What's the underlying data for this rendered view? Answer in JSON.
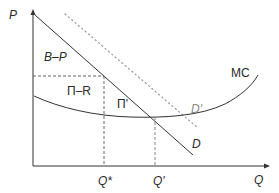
{
  "diagram": {
    "type": "economics-supply-demand",
    "axes": {
      "y_label": "P",
      "x_label": "Q"
    },
    "curves": {
      "demand": {
        "label": "D",
        "style": "solid"
      },
      "demand_shifted": {
        "label": "D'",
        "style": "dotted"
      },
      "marginal_cost": {
        "label": "MC",
        "style": "solid"
      }
    },
    "regions": {
      "upper": "B–P",
      "middle": "Π–R",
      "triangle": "Π'"
    },
    "quantities": {
      "q_star": "Q*",
      "q_prime": "Q'"
    },
    "colors": {
      "line": "#333333",
      "dotted": "#9a9a9a",
      "dashed": "#555555"
    }
  }
}
